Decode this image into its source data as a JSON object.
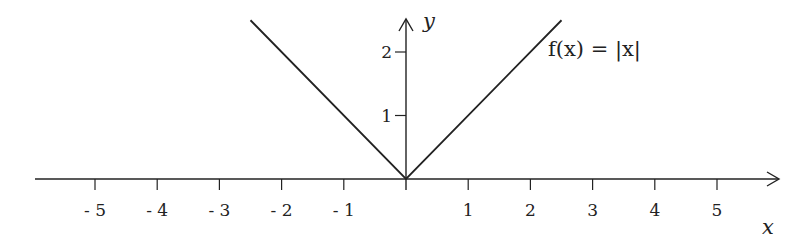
{
  "chart_data": {
    "type": "line",
    "title": "",
    "xlabel": "x",
    "ylabel": "y",
    "xlim": [
      -5.9,
      5.9
    ],
    "ylim": [
      0,
      2.6
    ],
    "grid": false,
    "x_ticks": [
      -5,
      -4,
      -3,
      -2,
      -1,
      1,
      2,
      3,
      4,
      5
    ],
    "x_tick_labels": [
      "- 5",
      "- 4",
      "- 3",
      "- 2",
      "- 1",
      "1",
      "2",
      "3",
      "4",
      "5"
    ],
    "y_ticks": [
      1,
      2
    ],
    "y_tick_labels": [
      "1",
      "2"
    ],
    "series": [
      {
        "name": "f(x) = |x|",
        "x": [
          -2.5,
          0,
          2.5
        ],
        "y": [
          2.5,
          0,
          2.5
        ],
        "color": "#222222"
      }
    ],
    "annotations": [
      {
        "text": "f(x) = |x|",
        "x": 2.3,
        "y": 2.1
      }
    ],
    "legend": "none"
  }
}
